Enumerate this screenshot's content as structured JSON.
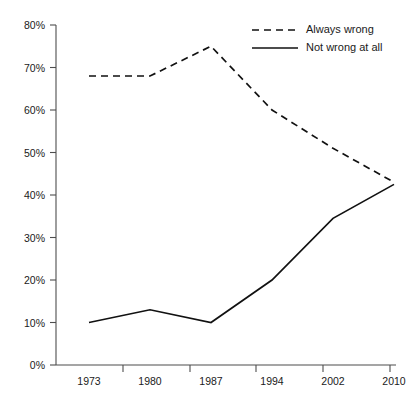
{
  "chart_data": {
    "type": "line",
    "title": "",
    "xlabel": "",
    "ylabel": "",
    "categories": [
      1973,
      1980,
      1987,
      1994,
      2002,
      2010
    ],
    "x_tick_labels": [
      "1973",
      "1980",
      "1987",
      "1994",
      "2002",
      "2010"
    ],
    "y_tick_labels": [
      "0%",
      "10%",
      "20%",
      "30%",
      "40%",
      "50%",
      "60%",
      "70%",
      "80%"
    ],
    "y_tick_values": [
      0,
      10,
      20,
      30,
      40,
      50,
      60,
      70,
      80
    ],
    "ylim": [
      0,
      80
    ],
    "grid": false,
    "legend_position": "top-right",
    "series": [
      {
        "name": "Always wrong",
        "style": "dashed",
        "color": "#111111",
        "values": [
          68,
          68,
          75,
          60,
          51,
          43
        ]
      },
      {
        "name": "Not wrong at all",
        "style": "solid",
        "color": "#111111",
        "values": [
          10,
          13,
          10,
          20,
          34.5,
          42.5
        ]
      }
    ]
  },
  "legend": {
    "entries": [
      {
        "label": "Always wrong",
        "style": "dashed"
      },
      {
        "label": "Not wrong at all",
        "style": "solid"
      }
    ]
  },
  "axes": {
    "y_labels": [
      "80%",
      "70%",
      "60%",
      "50%",
      "40%",
      "30%",
      "20%",
      "10%",
      "0%"
    ],
    "x_labels": [
      "1973",
      "1980",
      "1987",
      "1994",
      "2002",
      "2010"
    ]
  }
}
